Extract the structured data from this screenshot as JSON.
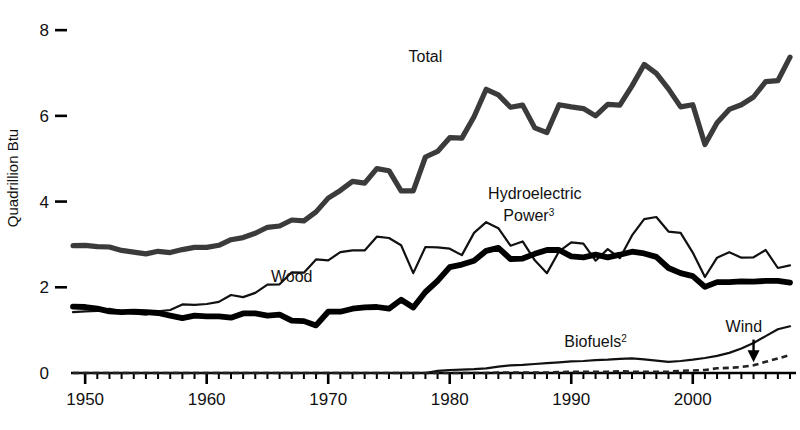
{
  "chart_data": {
    "type": "line",
    "title": "",
    "subtitle": "",
    "xlabel": "",
    "ylabel": "Quadrillion Btu",
    "xlim": [
      1949,
      2008
    ],
    "ylim": [
      0,
      8.4
    ],
    "yticks": [
      0,
      2,
      4,
      6,
      8
    ],
    "ytick_labels": [
      "0",
      "2",
      "4",
      "6",
      "8"
    ],
    "xticks": [
      1950,
      1960,
      1970,
      1980,
      1990,
      2000
    ],
    "xtick_labels": [
      "1950",
      "1960",
      "1970",
      "1980",
      "1990",
      "2000"
    ],
    "minor_xtick_interval": 1,
    "grid": false,
    "legend": "inline-annotations",
    "x": [
      1949,
      1950,
      1951,
      1952,
      1953,
      1954,
      1955,
      1956,
      1957,
      1958,
      1959,
      1960,
      1961,
      1962,
      1963,
      1964,
      1965,
      1966,
      1967,
      1968,
      1969,
      1970,
      1971,
      1972,
      1973,
      1974,
      1975,
      1976,
      1977,
      1978,
      1979,
      1980,
      1981,
      1982,
      1983,
      1984,
      1985,
      1986,
      1987,
      1988,
      1989,
      1990,
      1991,
      1992,
      1993,
      1994,
      1995,
      1996,
      1997,
      1998,
      1999,
      2000,
      2001,
      2002,
      2003,
      2004,
      2005,
      2006,
      2007,
      2008
    ],
    "series": [
      {
        "name": "Total",
        "style": "solid-thick-gray",
        "color": "#3b3b3b",
        "label": "Total",
        "label_x": 1978,
        "label_y": 7.25,
        "values": [
          2.97,
          2.98,
          2.95,
          2.94,
          2.86,
          2.82,
          2.78,
          2.84,
          2.81,
          2.88,
          2.93,
          2.93,
          2.98,
          3.11,
          3.16,
          3.26,
          3.4,
          3.43,
          3.57,
          3.55,
          3.76,
          4.08,
          4.26,
          4.47,
          4.43,
          4.77,
          4.72,
          4.25,
          4.25,
          5.04,
          5.17,
          5.49,
          5.48,
          5.98,
          6.62,
          6.49,
          6.2,
          6.25,
          5.72,
          5.61,
          6.26,
          6.21,
          6.17,
          6.0,
          6.27,
          6.25,
          6.7,
          7.2,
          6.99,
          6.63,
          6.21,
          6.26,
          5.33,
          5.84,
          6.15,
          6.26,
          6.44,
          6.8,
          6.82,
          7.37
        ]
      },
      {
        "name": "Hydroelectric Power",
        "style": "solid-thin-black",
        "color": "#111111",
        "label": "Hydroelectric Power",
        "label_superscript": "3",
        "label_x": 1987,
        "label_y": 4.05,
        "values": [
          1.42,
          1.44,
          1.45,
          1.5,
          1.44,
          1.39,
          1.36,
          1.44,
          1.47,
          1.6,
          1.59,
          1.61,
          1.66,
          1.82,
          1.77,
          1.87,
          2.06,
          2.07,
          2.35,
          2.34,
          2.65,
          2.63,
          2.82,
          2.86,
          2.86,
          3.18,
          3.15,
          2.98,
          2.33,
          2.94,
          2.93,
          2.9,
          2.75,
          3.27,
          3.52,
          3.38,
          2.97,
          3.07,
          2.63,
          2.33,
          2.84,
          3.05,
          3.02,
          2.62,
          2.89,
          2.68,
          3.21,
          3.59,
          3.64,
          3.3,
          3.27,
          2.81,
          2.24,
          2.69,
          2.82,
          2.69,
          2.7,
          2.87,
          2.45,
          2.51
        ]
      },
      {
        "name": "Wood",
        "style": "solid-extrathick-black",
        "color": "#000000",
        "label": "Wood",
        "label_x": 1967,
        "label_y": 2.12,
        "values": [
          1.55,
          1.54,
          1.5,
          1.44,
          1.42,
          1.43,
          1.42,
          1.4,
          1.34,
          1.28,
          1.34,
          1.32,
          1.32,
          1.29,
          1.39,
          1.39,
          1.34,
          1.36,
          1.22,
          1.21,
          1.11,
          1.43,
          1.43,
          1.5,
          1.53,
          1.54,
          1.5,
          1.71,
          1.53,
          1.89,
          2.15,
          2.47,
          2.53,
          2.62,
          2.85,
          2.92,
          2.66,
          2.67,
          2.78,
          2.87,
          2.87,
          2.72,
          2.7,
          2.76,
          2.7,
          2.76,
          2.83,
          2.79,
          2.71,
          2.45,
          2.33,
          2.26,
          2.01,
          2.12,
          2.12,
          2.14,
          2.13,
          2.15,
          2.15,
          2.11
        ]
      },
      {
        "name": "Biofuels",
        "style": "solid-thin-black",
        "color": "#111111",
        "label": "Biofuels",
        "label_superscript": "2",
        "label_x": 1992,
        "label_y": 0.6,
        "values": [
          0,
          0,
          0,
          0,
          0,
          0,
          0,
          0,
          0,
          0,
          0,
          0,
          0,
          0,
          0,
          0,
          0,
          0,
          0,
          0,
          0,
          0,
          0,
          0,
          0,
          0,
          0,
          0,
          0,
          0,
          0.05,
          0.07,
          0.08,
          0.09,
          0.11,
          0.15,
          0.18,
          0.19,
          0.21,
          0.23,
          0.25,
          0.27,
          0.28,
          0.3,
          0.31,
          0.33,
          0.34,
          0.32,
          0.29,
          0.26,
          0.28,
          0.31,
          0.35,
          0.4,
          0.47,
          0.57,
          0.7,
          0.86,
          1.02,
          1.09
        ]
      },
      {
        "name": "Wind",
        "style": "dashed-thin-black",
        "color": "#222222",
        "label": "Wind",
        "label_x": 2004.2,
        "label_y": 0.96,
        "values": [
          0,
          0,
          0,
          0,
          0,
          0,
          0,
          0,
          0,
          0,
          0,
          0,
          0,
          0,
          0,
          0,
          0,
          0,
          0,
          0,
          0,
          0,
          0,
          0,
          0,
          0,
          0,
          0,
          0,
          0,
          0,
          0,
          0,
          0.0,
          0.0,
          0.01,
          0.01,
          0.01,
          0.01,
          0.01,
          0.02,
          0.03,
          0.03,
          0.03,
          0.03,
          0.04,
          0.03,
          0.03,
          0.03,
          0.03,
          0.05,
          0.06,
          0.07,
          0.11,
          0.12,
          0.14,
          0.18,
          0.26,
          0.34,
          0.42
        ]
      }
    ],
    "annotations": [
      {
        "name": "wind-arrow",
        "type": "arrow",
        "from_x": 2005.0,
        "from_y": 0.78,
        "to_x": 2005.0,
        "to_y": 0.3
      }
    ]
  }
}
